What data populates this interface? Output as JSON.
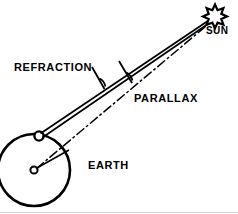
{
  "figure": {
    "type": "astronomy-schematic",
    "width": 238,
    "height": 214,
    "background_color": "#ffffff",
    "stroke_color": "#000000"
  },
  "labels": {
    "refraction": "REFRACTION",
    "parallax": "PARALLAX",
    "earth": "EARTH",
    "sun": "SUN"
  },
  "icons": {
    "sun": "sun-star-icon",
    "earth": "earth-circle-icon",
    "observer": "observer-point-icon",
    "center": "earth-center-icon"
  },
  "geometry": {
    "earth_circle": {
      "cx": 34,
      "cy": 170,
      "r": 36
    },
    "earth_center_dot": {
      "cx": 34,
      "cy": 170,
      "r": 3.5
    },
    "observer_point": {
      "cx": 39,
      "cy": 136,
      "r": 4.5
    },
    "sun_star": {
      "cx": 215,
      "cy": 14,
      "r_outer": 9,
      "r_inner": 4.2,
      "points": 8
    },
    "radius_line": {
      "x1": 36,
      "y1": 168,
      "x2": 68,
      "y2": 150
    },
    "refracted_ray": {
      "x1": 40,
      "y1": 134,
      "x2": 209,
      "y2": 20,
      "style": "solid"
    },
    "apparent_ray": {
      "x1": 42,
      "y1": 137,
      "x2": 211,
      "y2": 22,
      "style": "solid"
    },
    "geocentric_ray": {
      "x1": 36,
      "y1": 169,
      "x2": 211,
      "y2": 21,
      "style": "dash-dot"
    },
    "refraction_angle_arc": {
      "vertex_x": 98,
      "vertex_y": 77
    },
    "parallax_angle_arc": {
      "vertex_x": 125,
      "vertex_y": 70
    }
  },
  "annotations": {
    "refraction_tick_start": {
      "x": 93,
      "y": 68
    },
    "refraction_tick_end": {
      "x": 104,
      "y": 88
    },
    "parallax_tick_start": {
      "x": 120,
      "y": 62
    },
    "parallax_tick_end": {
      "x": 131,
      "y": 82
    }
  }
}
